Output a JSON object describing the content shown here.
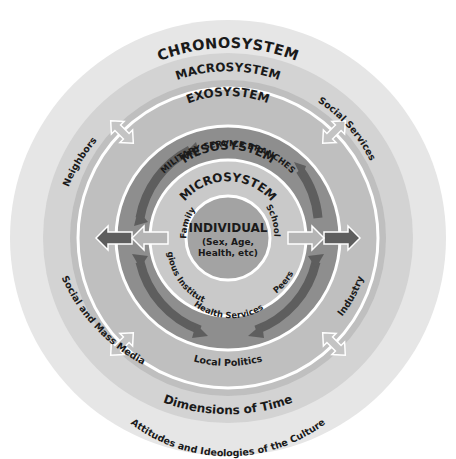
{
  "diagram": {
    "type": "concentric-systems",
    "colors": {
      "chronosystem": "#e6e6e6",
      "macrosystem": "#d3d3d3",
      "exosystem": "#bfbfbf",
      "mesosystem": "#8e8e8e",
      "microsystem": "#c9c9c9",
      "individual": "#a3a3a3",
      "ring_line": "#ffffff",
      "arrow_dark": "#5e5e5e",
      "arrow_light": "#b5b5b5"
    },
    "layers": {
      "chronosystem": {
        "title": "CHRONOSYSTEM",
        "bottom": "Dimensions of Time"
      },
      "macrosystem": {
        "title": "MACROSYSTEM",
        "bottom": "Attitudes and Ideologies of the Culture"
      },
      "exosystem": {
        "title": "EXOSYSTEM",
        "items": {
          "top_left": "Neighbors",
          "top_right": "Social Services",
          "left": "Social and Mass Media",
          "right": "Industry",
          "bottom": "Local Politics"
        }
      },
      "mesosystem": {
        "title": "MESOSYSTEM",
        "subtitle": "MILITARY SERVICE BRANCHES"
      },
      "microsystem": {
        "title": "MICROSYSTEM",
        "items": {
          "left": "Family",
          "right": "School",
          "bottom_left": "Religious Institutions",
          "bottom": "Health Services",
          "bottom_right": "Peers"
        }
      },
      "individual": {
        "title": "INDIVIDUAL",
        "line1": "(Sex, Age,",
        "line2": "Health, etc)"
      }
    }
  }
}
